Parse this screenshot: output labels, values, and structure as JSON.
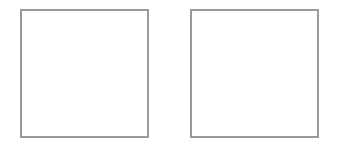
{
  "canvas": {
    "width": 349,
    "height": 155,
    "background": "#ffffff"
  },
  "panels": [
    {
      "id": "left",
      "label": "",
      "x": 20,
      "y": 9,
      "width": 129,
      "height": 129,
      "border_color": "#9a9a9a",
      "border_width": 2,
      "fill": "#ffffff"
    },
    {
      "id": "right",
      "label": "",
      "x": 190,
      "y": 9,
      "width": 129,
      "height": 129,
      "border_color": "#9a9a9a",
      "border_width": 2,
      "fill": "#ffffff"
    }
  ]
}
